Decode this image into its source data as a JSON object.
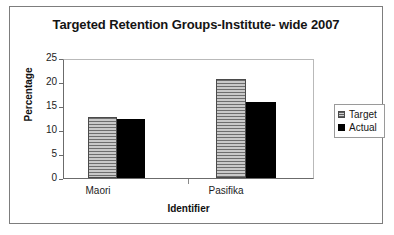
{
  "chart_data": {
    "type": "bar",
    "title": "Targeted Retention Groups-Institute- wide 2007",
    "xlabel": "Identifier",
    "ylabel": "Percentage",
    "categories": [
      "Maori",
      "Pasifika"
    ],
    "series": [
      {
        "name": "Target",
        "values": [
          13,
          21
        ],
        "color": "#9a9a9a",
        "fill": "horizontal-hatch"
      },
      {
        "name": "Actual",
        "values": [
          12.5,
          16
        ],
        "color": "#000000",
        "fill": "solid"
      }
    ],
    "ylim": [
      0,
      25
    ],
    "yticks": [
      0,
      5,
      10,
      15,
      20,
      25
    ],
    "ytick_labels": [
      "0",
      "5",
      "10",
      "15",
      "20",
      "25"
    ],
    "grid": false,
    "legend_position": "right"
  },
  "legend": {
    "entries": [
      {
        "label": "Target"
      },
      {
        "label": "Actual"
      }
    ]
  }
}
